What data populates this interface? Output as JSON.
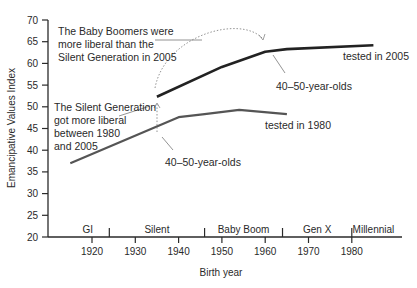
{
  "chart_data": {
    "type": "line",
    "title": "",
    "xlabel": "Birth year",
    "ylabel": "Emancipative Values Index",
    "ylim": [
      20,
      70
    ],
    "xlim": [
      1914,
      1990
    ],
    "y_ticks": [
      20,
      25,
      30,
      35,
      40,
      45,
      50,
      55,
      60,
      65,
      70
    ],
    "x_ticks": [
      1920,
      1930,
      1940,
      1950,
      1960,
      1970,
      1980
    ],
    "grid": false,
    "generations": [
      {
        "label": "GI",
        "start": 1914,
        "end": 1924
      },
      {
        "label": "Silent",
        "start": 1924,
        "end": 1946
      },
      {
        "label": "Baby Boom",
        "start": 1946,
        "end": 1964
      },
      {
        "label": "Gen X",
        "start": 1964,
        "end": 1980
      },
      {
        "label": "Millennial",
        "start": 1980,
        "end": 1990
      }
    ],
    "series": [
      {
        "name": "tested in 2005",
        "color": "#222222",
        "x": [
          1935,
          1950,
          1960,
          1965,
          1985
        ],
        "values": [
          52.3,
          59.2,
          62.7,
          63.3,
          64.2
        ]
      },
      {
        "name": "tested in 1980",
        "color": "#555555",
        "x": [
          1915,
          1940,
          1946,
          1954,
          1965
        ],
        "values": [
          37.0,
          47.6,
          48.3,
          49.3,
          48.3
        ]
      }
    ],
    "annotations": [
      {
        "text": "The Baby Boomers were more liberal than the Silent Generation in 2005"
      },
      {
        "text": "The Silent Generation got more liberal between 1980 and 2005"
      },
      {
        "text": "40–50-year-olds",
        "series": "tested in 2005"
      },
      {
        "text": "40–50-year-olds",
        "series": "tested in 1980"
      },
      {
        "text": "tested in 2005"
      },
      {
        "text": "tested in 1980"
      }
    ]
  },
  "labels": {
    "ylabel": "Emancipative Values Index",
    "xlabel": "Birth year",
    "yticks": [
      "20",
      "25",
      "30",
      "35",
      "40",
      "45",
      "50",
      "55",
      "60",
      "65",
      "70"
    ],
    "xticks": [
      "1920",
      "1930",
      "1940",
      "1950",
      "1960",
      "1970",
      "1980"
    ],
    "generations": [
      "GI",
      "Silent",
      "Baby Boom",
      "Gen X",
      "Millennial"
    ],
    "ann_boomers": [
      "The Baby Boomers were",
      "more liberal than the",
      "Silent Generation in 2005"
    ],
    "ann_silent": [
      "The Silent Generation",
      "got more liberal",
      "between 1980",
      "and 2005"
    ],
    "ann_age_2005": "40–50-year-olds",
    "ann_age_1980": "40–50-year-olds",
    "series_2005": "tested in 2005",
    "series_1980": "tested in 1980"
  }
}
